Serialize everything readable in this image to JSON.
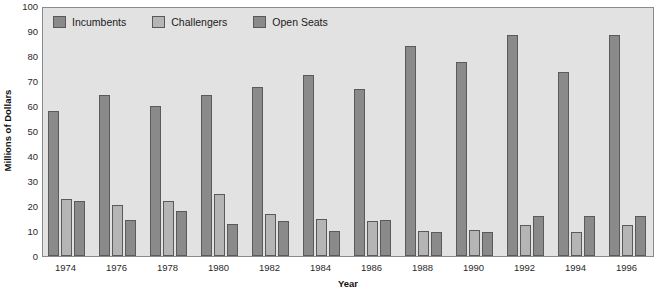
{
  "chart_data": {
    "type": "bar",
    "title": "",
    "xlabel": "Year",
    "ylabel": "Millions of Dollars",
    "ylim": [
      0,
      100
    ],
    "yticks": [
      0,
      10,
      20,
      30,
      40,
      50,
      60,
      70,
      80,
      90,
      100
    ],
    "grid": false,
    "legend_position": "top-left",
    "categories": [
      "1974",
      "1976",
      "1978",
      "1980",
      "1982",
      "1984",
      "1986",
      "1988",
      "1990",
      "1992",
      "1994",
      "1996"
    ],
    "series": [
      {
        "name": "Incumbents",
        "color": "#8a8a8a",
        "values": [
          58,
          64.5,
          60,
          64.5,
          67.5,
          72.5,
          67,
          84,
          77.5,
          88.5,
          73.5,
          88.5
        ]
      },
      {
        "name": "Challengers",
        "color": "#b5b5b5",
        "values": [
          23,
          20.5,
          22,
          25,
          17,
          15,
          14,
          10,
          10.5,
          12.5,
          9.5,
          12.5
        ]
      },
      {
        "name": "Open Seats",
        "color": "#8a8a8a",
        "values": [
          22,
          14.5,
          18,
          13,
          14,
          10,
          14.5,
          9.5,
          9.5,
          16,
          16,
          16
        ]
      }
    ]
  },
  "colors": {
    "plot_background": "#e2e2e2",
    "page_background": "#ffffff",
    "axis_line": "#8a8a8a",
    "bar_outline": "#5a5a5a",
    "text": "#1a1a1a"
  }
}
